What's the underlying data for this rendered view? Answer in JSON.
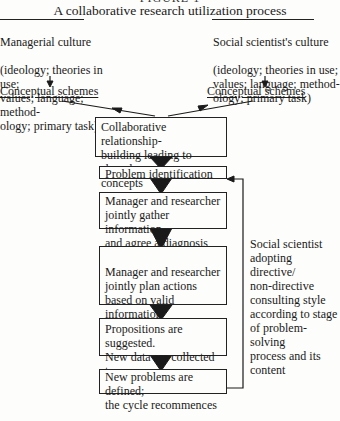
{
  "figure_label": "FIGURE 1",
  "title": "A collaborative research utilization process",
  "left_culture": {
    "heading": "Managerial culture",
    "body": "(ideology; theories in use;\nvalues; language; method-\nology; primary task)",
    "output": "Conceptual schemes"
  },
  "right_culture": {
    "heading": "Social scientist's culture",
    "body": "(ideology; theories in use;\nvalues; language; method-\nology; primary task)",
    "output": "Conceptual schemes"
  },
  "process_steps": [
    {
      "text": "Collaborative relationship-\nbuilding leading to shared\nconcepts"
    },
    {
      "text": "Problem identification"
    },
    {
      "text": "Manager and researcher\njointly gather information\nand agree a diagnosis"
    },
    {
      "text": "Manager and researcher\njointly plan actions\nbased on valid information"
    },
    {
      "text": "Propositions are suggested.\nNew data are collected to\ntest them"
    },
    {
      "text": "New problems are defined;\nthe cycle recommences"
    }
  ],
  "feedback_note": "Social scientist\nadopting directive/\nnon-directive\nconsulting style\naccording to stage\nof problem-solving\nprocess and its\ncontent",
  "colors": {
    "ink": "#1a1a1a",
    "paper": "#fdfdfb"
  }
}
